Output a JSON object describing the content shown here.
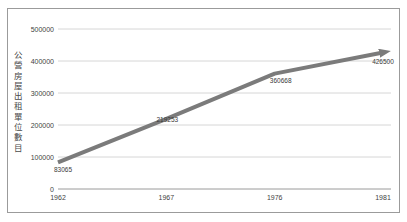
{
  "chart": {
    "frame_color": "#9b9b9b",
    "grid_color": "#d6d6d6",
    "axis_color": "#9a9a9a",
    "line_color": "#7b7b7b",
    "text_color": "#3f3f3f"
  },
  "chart_data": {
    "type": "line",
    "categories": [
      "1962",
      "1967",
      "1976",
      "1981"
    ],
    "values": [
      83065,
      219253,
      360668,
      426500
    ],
    "point_labels": [
      "83065",
      "219253",
      "360668",
      "426500"
    ],
    "title": "",
    "xlabel": "",
    "ylabel": "公營房屋出租單位數目",
    "ylim": [
      0,
      500000
    ],
    "yticks": [
      0,
      100000,
      200000,
      300000,
      400000,
      500000
    ],
    "ytick_labels": [
      "0",
      "100000",
      "200000",
      "300000",
      "400000",
      "500000"
    ],
    "grid": true,
    "legend": false,
    "arrow_end": true
  }
}
